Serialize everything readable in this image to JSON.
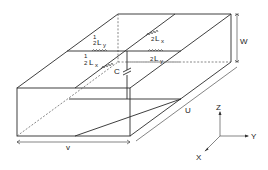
{
  "diagram": {
    "title": "",
    "dimensions": {
      "width_label": "W",
      "length_label": "U",
      "depth_label": "V"
    },
    "circuit_labels": {
      "ly_left": {
        "frac": "1/2",
        "sym": "L",
        "sub": "y"
      },
      "lx_right": {
        "frac": "1/2",
        "sym": "L",
        "sub": "x"
      },
      "lx_left": {
        "frac": "1/2",
        "sym": "L",
        "sub": "x"
      },
      "ly_right": {
        "frac": "1/2",
        "sym": "L",
        "sub": "y"
      },
      "capacitor": "C"
    },
    "axes": {
      "z": "Z",
      "y": "Y",
      "x": "X"
    },
    "fraction_text": {
      "num": "1",
      "den": "2"
    }
  }
}
